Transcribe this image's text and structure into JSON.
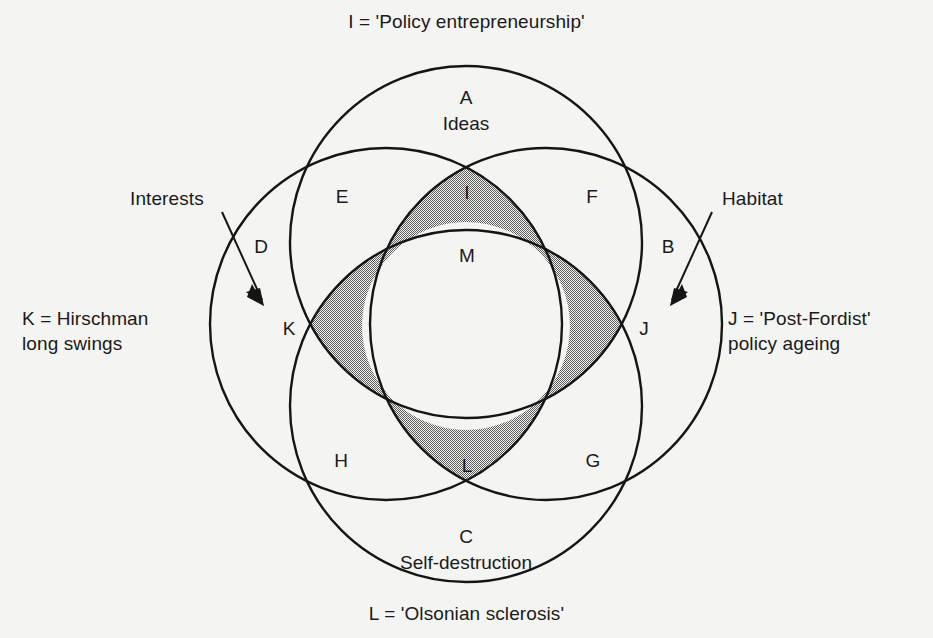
{
  "diagram": {
    "title_top": "I = 'Policy entrepreneurship'",
    "title_bottom": "L = 'Olsonian sclerosis'",
    "annotations": {
      "left_pointer_label": "Interests",
      "right_pointer_label": "Habitat",
      "left_legend": "K = Hirschman\nlong swings",
      "right_legend": "J = 'Post-Fordist'\npolicy ageing"
    },
    "circles": [
      {
        "id": "top",
        "letter": "A",
        "name": "Ideas"
      },
      {
        "id": "bottom",
        "letter": "C",
        "name": "Self-destruction"
      },
      {
        "id": "left",
        "letter": "D",
        "name": ""
      },
      {
        "id": "right",
        "letter": "B",
        "name": ""
      }
    ],
    "regions": [
      {
        "letter": "A",
        "name": "Ideas",
        "shaded": false
      },
      {
        "letter": "B",
        "name": "",
        "shaded": false
      },
      {
        "letter": "C",
        "name": "Self-destruction",
        "shaded": false
      },
      {
        "letter": "D",
        "name": "",
        "shaded": false
      },
      {
        "letter": "E",
        "name": "",
        "shaded": false
      },
      {
        "letter": "F",
        "name": "",
        "shaded": false
      },
      {
        "letter": "G",
        "name": "",
        "shaded": false
      },
      {
        "letter": "H",
        "name": "",
        "shaded": false
      },
      {
        "letter": "I",
        "name": "",
        "shaded": true
      },
      {
        "letter": "J",
        "name": "",
        "shaded": true
      },
      {
        "letter": "K",
        "name": "",
        "shaded": true
      },
      {
        "letter": "L",
        "name": "",
        "shaded": true
      },
      {
        "letter": "M",
        "name": "",
        "shaded": false
      }
    ],
    "colors": {
      "background": "#f4f4f2",
      "stroke": "#151515",
      "shading": "#a9a9a9",
      "text": "#1a1a1a"
    }
  }
}
